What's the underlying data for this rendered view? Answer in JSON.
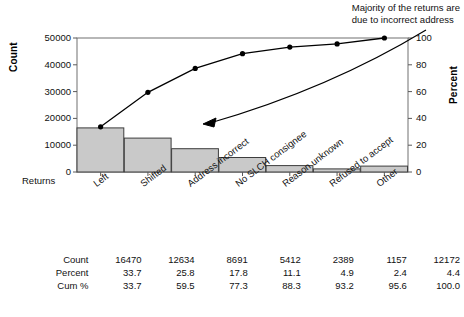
{
  "annotation": {
    "line1": "Majority of the returns are",
    "line2": "due to incorrect address"
  },
  "chart_data": {
    "type": "bar",
    "title": "",
    "subtitle": "",
    "xlabel": "Returns",
    "ylabel": "Count",
    "y2label": "Percent",
    "grid": false,
    "legend": "none",
    "ylim": [
      0,
      50000
    ],
    "y2lim": [
      0,
      100
    ],
    "categories": [
      "Left",
      "Shifted",
      "Address incorrect",
      "No SLCH consignee",
      "Reason unknown",
      "Refused to accept",
      "Other"
    ],
    "values": [
      16470,
      12634,
      8691,
      5412,
      2389,
      1157,
      12172
    ],
    "series": [
      {
        "name": "Count",
        "type": "bar",
        "values": [
          16470,
          12634,
          8691,
          5412,
          2389,
          1157,
          12172
        ]
      },
      {
        "name": "Cum %",
        "type": "line",
        "values": [
          33.7,
          59.5,
          77.3,
          88.3,
          93.2,
          95.6,
          100.0
        ]
      }
    ],
    "percent": [
      33.7,
      25.8,
      17.8,
      11.1,
      4.9,
      2.4,
      4.4
    ],
    "cum_percent": [
      33.7,
      59.5,
      77.3,
      88.3,
      93.2,
      95.6,
      100.0
    ],
    "yticks": [
      "0",
      "10000",
      "20000",
      "30000",
      "40000",
      "50000"
    ],
    "ytick_values": [
      0,
      10000,
      20000,
      30000,
      40000,
      50000
    ],
    "y2ticks": [
      "0",
      "20",
      "40",
      "60",
      "80",
      "100"
    ],
    "y2tick_values": [
      0,
      20,
      40,
      60,
      80,
      100
    ],
    "annotations": [
      "Majority of the returns are due to incorrect address"
    ],
    "colors": {
      "bar_fill": "#c9c9c9",
      "bar_stroke": "#3d3d3d",
      "line": "#000000",
      "axis": "#5a5a5a",
      "text": "#111111"
    }
  },
  "table": {
    "rows": [
      {
        "label": "Count",
        "cells": [
          "16470",
          "12634",
          "8691",
          "5412",
          "2389",
          "1157",
          "12172"
        ]
      },
      {
        "label": "Percent",
        "cells": [
          "33.7",
          "25.8",
          "17.8",
          "11.1",
          "4.9",
          "2.4",
          "4.4"
        ]
      },
      {
        "label": "Cum %",
        "cells": [
          "33.7",
          "59.5",
          "77.3",
          "88.3",
          "93.2",
          "95.6",
          "100.0"
        ]
      }
    ]
  }
}
